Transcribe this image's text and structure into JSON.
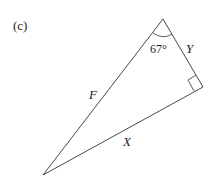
{
  "diagram": {
    "part_label": "(c)",
    "angle_label": "67°",
    "sides": {
      "hypotenuse": "F",
      "adjacent_short": "Y",
      "opposite_long": "X"
    },
    "right_angle_marker": true
  }
}
